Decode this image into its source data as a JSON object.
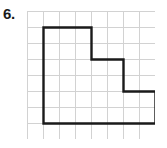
{
  "problem": {
    "number_label": "6."
  },
  "figure": {
    "type": "grid-polygon",
    "grid": {
      "columns": 8,
      "rows": 8,
      "cell_size_px": 16,
      "origin_x_px": 27,
      "origin_y_px": 11,
      "line_color": "#d2d2d2",
      "line_width_px": 1
    },
    "polygon": {
      "stroke_color": "#1a1a1a",
      "stroke_width_px": 2.4,
      "fill": "none",
      "vertices_grid_units": [
        [
          1,
          1
        ],
        [
          4,
          1
        ],
        [
          4,
          3
        ],
        [
          6,
          3
        ],
        [
          6,
          5
        ],
        [
          8,
          5
        ],
        [
          8,
          7
        ],
        [
          1,
          7
        ]
      ]
    }
  },
  "colors": {
    "background": "#ffffff",
    "ink": "#1a1a1a",
    "grid_line": "#d2d2d2"
  }
}
